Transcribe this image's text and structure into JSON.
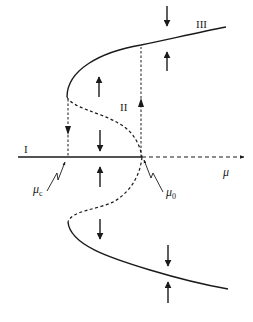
{
  "diagram": {
    "type": "subcritical pitchfork bifurcation with hysteresis",
    "colors": {
      "ink": "#1a1a1a",
      "background": "#ffffff"
    },
    "labels": {
      "branch_I": "I",
      "branch_II": "II",
      "branch_III": "III",
      "axis_mu": "μ",
      "mu_c_symbol": "μ",
      "mu_c_subscript": "c",
      "mu_0_symbol": "μ",
      "mu_0_subscript": "0"
    },
    "geometry": {
      "axis_y": 157,
      "axis_start_x": 18,
      "mu_0_x": 142,
      "mu_c_x": 68,
      "axis_end_x": 244,
      "upper_turning_point": [
        67,
        97
      ],
      "lower_turning_point": [
        68,
        222
      ],
      "upper_stable_end": [
        226,
        27
      ],
      "lower_stable_end": [
        228,
        289
      ]
    },
    "branches": [
      {
        "name": "I",
        "style": "solid",
        "description": "stable trivial branch for μ < μ0"
      },
      {
        "name": "trivial-unstable",
        "style": "dashed",
        "description": "unstable trivial branch for μ > μ0"
      },
      {
        "name": "unstable-upper",
        "style": "dashed",
        "description": "unstable nontrivial branch from μ0 to μc (upper)"
      },
      {
        "name": "unstable-lower",
        "style": "dashed",
        "description": "unstable nontrivial branch from μ0 to μc (lower)"
      },
      {
        "name": "III-upper",
        "style": "solid",
        "description": "stable large-amplitude branch (upper)"
      },
      {
        "name": "III-lower",
        "style": "solid",
        "description": "stable large-amplitude branch (lower)"
      }
    ],
    "jumps": [
      {
        "name": "II",
        "direction": "up",
        "at": "μ0",
        "style": "dashed"
      },
      {
        "name": "drop",
        "direction": "down",
        "at": "μc",
        "style": "dashed"
      }
    ],
    "flow_arrows": [
      {
        "x": 167,
        "y1": 8,
        "y2": 26,
        "direction": "down"
      },
      {
        "x": 167,
        "y1": 70,
        "y2": 52,
        "direction": "up"
      },
      {
        "x": 99,
        "y1": 96,
        "y2": 78,
        "direction": "up"
      },
      {
        "x": 100,
        "y1": 132,
        "y2": 150,
        "direction": "down"
      },
      {
        "x": 100,
        "y1": 186,
        "y2": 168,
        "direction": "up"
      },
      {
        "x": 100,
        "y1": 220,
        "y2": 238,
        "direction": "down"
      },
      {
        "x": 168,
        "y1": 246,
        "y2": 265,
        "direction": "down"
      },
      {
        "x": 168,
        "y1": 302,
        "y2": 283,
        "direction": "up"
      }
    ]
  }
}
